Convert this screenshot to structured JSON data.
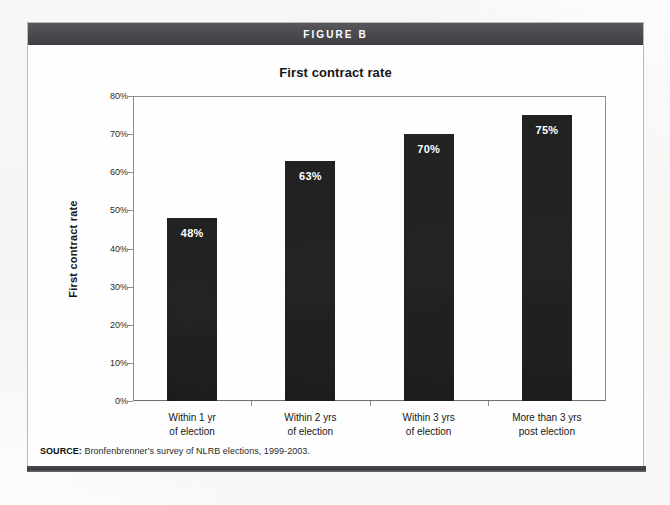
{
  "figure": {
    "header_label": "FIGURE B",
    "source_prefix": "SOURCE:",
    "source_text": " Bronfenbrenner's survey of NLRB elections, 1999-2003."
  },
  "colors": {
    "header_band": "#4b4a4e",
    "bar_fill": "#1a1a1a",
    "axis": "#8e8e8e",
    "value_label": "#ffffff"
  },
  "chart_data": {
    "type": "bar",
    "title": "First contract rate",
    "xlabel": "",
    "ylabel": "First contract rate",
    "ylim": [
      0,
      80
    ],
    "grid": false,
    "legend": null,
    "value_suffix": "%",
    "categories": [
      "Within 1 yr\nof election",
      "Within 2 yrs\nof election",
      "Within 3 yrs\nof election",
      "More than 3 yrs\npost election"
    ],
    "category_lines": [
      [
        "Within 1 yr",
        "of election"
      ],
      [
        "Within 2 yrs",
        "of election"
      ],
      [
        "Within 3 yrs",
        "of election"
      ],
      [
        "More than 3 yrs",
        "post election"
      ]
    ],
    "values": [
      48,
      63,
      70,
      75
    ],
    "value_labels": [
      "48%",
      "63%",
      "70%",
      "75%"
    ],
    "ytick_values": [
      80,
      70,
      60,
      50,
      40,
      30,
      20,
      10,
      0
    ],
    "ytick_labels": [
      "80%",
      "70%",
      "60%",
      "50%",
      "40%",
      "30%",
      "20%",
      "10%",
      "0%"
    ]
  }
}
